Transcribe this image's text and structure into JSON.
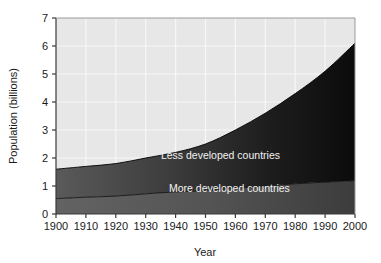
{
  "chart_data": {
    "type": "area",
    "title": "",
    "subtitle": "",
    "xlabel": "Year",
    "ylabel": "Population (billions)",
    "xlim": [
      1900,
      2000
    ],
    "ylim": [
      0,
      7
    ],
    "grid": true,
    "legend_position": "inline-labels",
    "stacked": true,
    "x": [
      1900,
      1910,
      1920,
      1930,
      1940,
      1950,
      1960,
      1970,
      1980,
      1990,
      2000
    ],
    "xticks": [
      "1900",
      "1910",
      "1920",
      "1930",
      "1940",
      "1950",
      "1960",
      "1970",
      "1980",
      "1990",
      "2000"
    ],
    "yticks": [
      "0",
      "1",
      "2",
      "3",
      "4",
      "5",
      "6",
      "7"
    ],
    "series": [
      {
        "name": "More developed countries",
        "color": "#555555",
        "values": [
          0.55,
          0.6,
          0.64,
          0.72,
          0.79,
          0.83,
          0.92,
          1.0,
          1.08,
          1.14,
          1.19
        ]
      },
      {
        "name": "Less developed countries",
        "color": "#2b2b2b",
        "values": [
          1.05,
          1.1,
          1.16,
          1.28,
          1.41,
          1.67,
          2.08,
          2.6,
          3.22,
          3.96,
          4.91
        ]
      }
    ],
    "totals": [
      1.6,
      1.7,
      1.8,
      2.0,
      2.2,
      2.5,
      3.0,
      3.6,
      4.3,
      5.1,
      6.1
    ],
    "annotations": [
      {
        "text": "Less developed countries",
        "x": 1955,
        "y": 1.95
      },
      {
        "text": "More developed countries",
        "x": 1958,
        "y": 0.78
      }
    ],
    "colors": {
      "plot_background": "#e7e7e7",
      "gridline": "#f7f7f7",
      "axis": "#3a3a3a",
      "page_background": "#ffffff",
      "label_text": "#f2f2f2"
    }
  }
}
